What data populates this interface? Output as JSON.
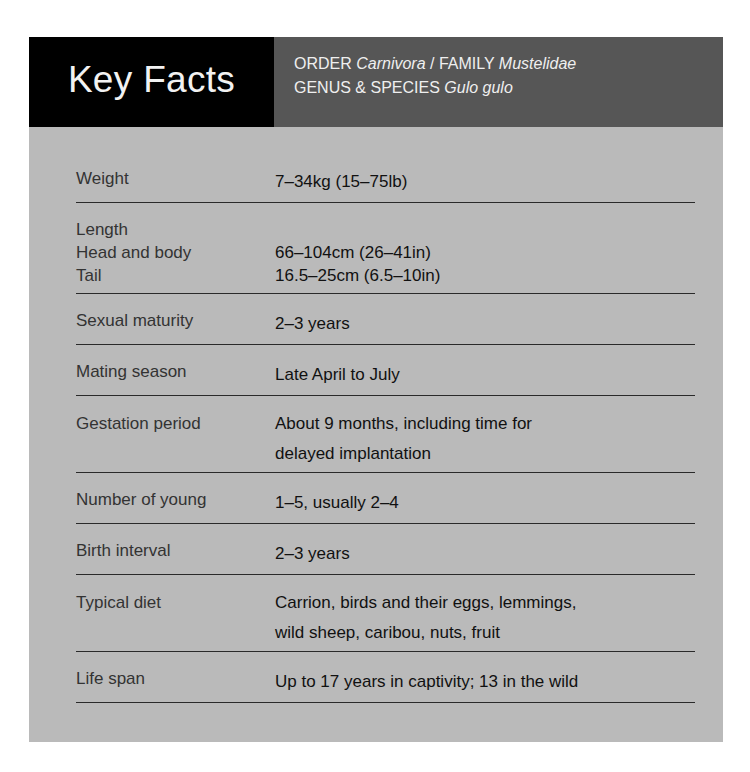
{
  "header": {
    "title": "Key Facts",
    "taxonomy": {
      "order_label": "ORDER",
      "order_value": "Carnivora",
      "separator": "/",
      "family_label": "FAMILY",
      "family_value": "Mustelidae",
      "genus_species_label": "GENUS & SPECIES",
      "genus_species_value": "Gulo gulo"
    }
  },
  "facts": [
    {
      "label": "Weight",
      "value": "7–34kg (15–75lb)"
    },
    {
      "label": "Length",
      "sub": [
        {
          "label": "Head and body",
          "value": "66–104cm (26–41in)"
        },
        {
          "label": "Tail",
          "value": "16.5–25cm (6.5–10in)"
        }
      ]
    },
    {
      "label": "Sexual maturity",
      "value": "2–3 years"
    },
    {
      "label": "Mating season",
      "value": "Late April to July"
    },
    {
      "label": "Gestation period",
      "value_lines": [
        "About 9 months, including time for",
        "delayed implantation"
      ]
    },
    {
      "label": "Number of young",
      "value": "1–5, usually 2–4"
    },
    {
      "label": "Birth interval",
      "value": "2–3 years"
    },
    {
      "label": "Typical diet",
      "value_lines": [
        "Carrion, birds and their eggs, lemmings,",
        "wild sheep, caribou, nuts, fruit"
      ]
    },
    {
      "label": "Life span",
      "value": "Up to 17 years in captivity; 13 in the wild"
    }
  ],
  "colors": {
    "title_bg": "#000000",
    "taxonomy_bg": "#565656",
    "body_bg": "#bababa",
    "rule": "#2a2a2a"
  }
}
